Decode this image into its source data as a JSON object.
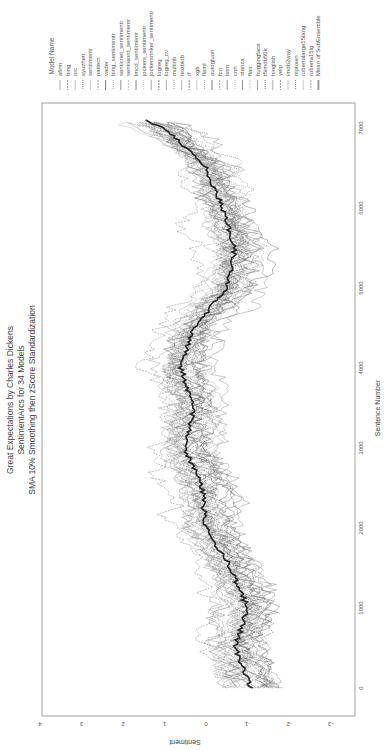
{
  "chart_data": {
    "type": "line",
    "orientation": "rotated-90",
    "title": "Great Expectations by Charles Dickens",
    "subtitle_lines": [
      "SentimentArcs for 34 Models",
      "SMA 10% Smoothing then zScore Standardization"
    ],
    "xlabel": "Sentence Number",
    "ylabel": "Sentiment",
    "xlim": [
      0,
      7100
    ],
    "ylim": [
      -3,
      4
    ],
    "x_ticks": [
      0,
      1000,
      2000,
      3000,
      4000,
      5000,
      6000,
      7000
    ],
    "y_ticks": [
      4,
      3,
      2,
      1,
      0,
      -1,
      -2,
      -3
    ],
    "grid": false,
    "legend_title": "Model Name",
    "legend_position": "top (rotated right)",
    "series_names": [
      "afinn",
      "bing",
      "nrc",
      "syuzhetr",
      "sentimentr",
      "pattern",
      "vader",
      "bing_sentimentr",
      "senticnet_sentimentr",
      "sentiword_sentimentr",
      "lmcd_sentimentr",
      "jockers_sentimentr",
      "jockersrinker_sentimentr",
      "logreg",
      "logreg_cv",
      "multinb",
      "textblob",
      "rf",
      "xgb",
      "flaml",
      "autogluon",
      "fcn",
      "lstm",
      "cnn",
      "stanza",
      "flair",
      "huggingface",
      "t5imdb50k",
      "hinglish",
      "yelp",
      "imdb2way",
      "nlptown",
      "robertalarge15lang",
      "roberta15lg",
      "Mean of SubEnsemble"
    ],
    "mean_series": {
      "name": "Mean of SubEnsemble",
      "x": [
        0,
        500,
        1000,
        1500,
        2000,
        2500,
        3000,
        3500,
        4000,
        4500,
        5000,
        5500,
        6000,
        6500,
        7000,
        7100
      ],
      "y": [
        -1.1,
        -0.7,
        -1.0,
        -0.6,
        0.0,
        0.1,
        0.5,
        0.3,
        0.6,
        0.3,
        -0.5,
        -0.7,
        -0.4,
        0.0,
        1.0,
        1.5
      ]
    },
    "approx_spread": 1.2
  },
  "title": {
    "line1": "Great Expectations by Charles Dickens",
    "line2": "SentimentArcs for 34 Models",
    "line3": "SMA 10% Smoothing then zScore Standardization"
  },
  "axes": {
    "x_label": "Sentence Number",
    "y_label": "Sentiment",
    "x_ticks": [
      "0",
      "1000",
      "2000",
      "3000",
      "4000",
      "5000",
      "6000",
      "7000"
    ],
    "y_ticks": [
      "4",
      "3",
      "2",
      "1",
      "0",
      "-1",
      "-2",
      "-3"
    ]
  },
  "legend": {
    "title": "Model Name",
    "items": [
      "afinn",
      "bing",
      "nrc",
      "syuzhetr",
      "sentimentr",
      "pattern",
      "vader",
      "bing_sentimentr",
      "senticnet_sentimentr",
      "sentiword_sentimentr",
      "lmcd_sentimentr",
      "jockers_sentimentr",
      "jockersrinker_sentimentr",
      "logreg",
      "logreg_cv",
      "multinb",
      "textblob",
      "rf",
      "xgb",
      "flaml",
      "autogluon",
      "fcn",
      "lstm",
      "cnn",
      "stanza",
      "flair",
      "huggingface",
      "t5imdb50k",
      "hinglish",
      "yelp",
      "imdb2way",
      "nlptown",
      "robertalarge15lang",
      "roberta15lg",
      "Mean of SubEnsemble"
    ]
  },
  "colors": {
    "frame": "#888888",
    "mean_line": "#222222",
    "series_grays": [
      "#999999",
      "#777777",
      "#aaaaaa",
      "#666666",
      "#bbbbbb",
      "#888888",
      "#555555"
    ]
  }
}
